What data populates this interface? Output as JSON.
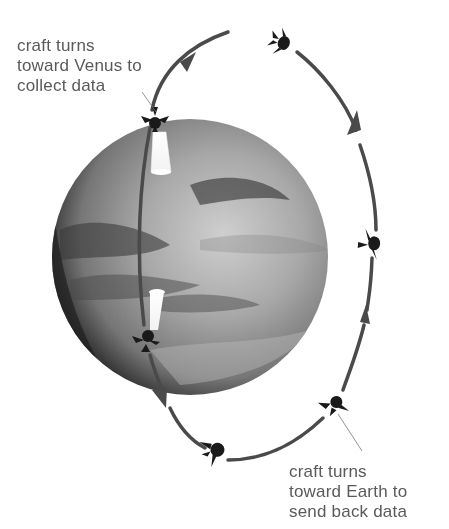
{
  "diagram": {
    "colors": {
      "orbit": "#4a4a4a",
      "spacecraft": "#1a1a1a",
      "label_text": "#5a5a5a",
      "planet_light": "#c8c8c8",
      "planet_dark": "#3a3a3a",
      "beam": "#ffffff"
    },
    "labels": {
      "venus": {
        "lines": [
          "craft turns",
          "toward Venus to",
          "collect data"
        ]
      },
      "earth": {
        "lines": [
          "craft turns",
          "toward Earth to",
          "send back data"
        ]
      }
    },
    "icons": {
      "spacecraft": "spacecraft-icon",
      "orbit_arrow": "arrow-icon",
      "planet": "venus-planet"
    },
    "spacecraft_positions": [
      {
        "x": 281,
        "y": 42,
        "state": "top"
      },
      {
        "x": 155,
        "y": 120,
        "state": "pointing toward Venus"
      },
      {
        "x": 146,
        "y": 340,
        "state": "pointing toward Venus"
      },
      {
        "x": 213,
        "y": 450,
        "state": "bottom"
      },
      {
        "x": 333,
        "y": 405,
        "state": "pointing toward Earth"
      },
      {
        "x": 370,
        "y": 245,
        "state": "right side"
      }
    ]
  }
}
